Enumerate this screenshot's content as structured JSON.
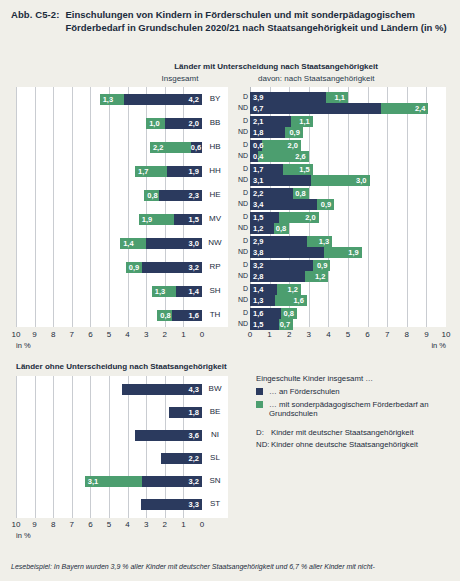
{
  "figure": {
    "number": "Abb. C5-2:",
    "title": "Einschulungen von Kindern in Förderschulen und mit sonderpädagogischem Förderbedarf in Grundschulen 2020/21 nach Staatsangehörigkeit und Ländern (in %)"
  },
  "section_top": {
    "heading": "Länder mit Unterscheidung nach Staatsangehörigkeit",
    "sub_left": "Insgesamt",
    "sub_right": "davon: nach Staatsangehörigkeit"
  },
  "section_bottom": {
    "heading": "Länder ohne Unterscheidung nach Staatsangehörigkeit"
  },
  "axis": {
    "ticks": [
      "10",
      "9",
      "8",
      "7",
      "6",
      "5",
      "4",
      "3",
      "2",
      "1",
      "0"
    ],
    "ticks_right": [
      "0",
      "1",
      "2",
      "3",
      "4",
      "5",
      "6",
      "7",
      "8",
      "9",
      "10"
    ],
    "unit": "in %",
    "max": 10
  },
  "legend": {
    "title": "Eingeschulte Kinder insgesamt …",
    "items": [
      {
        "color": "#2b3a5e",
        "label": "… an Förderschulen"
      },
      {
        "color": "#4c9e6f",
        "label": "… mit sonderpädagogischem Förderbedarf an Grundschulen"
      }
    ],
    "definitions": [
      {
        "key": "D:",
        "text": "Kinder mit deutscher Staatsangehörigkeit"
      },
      {
        "key": "ND:",
        "text": "Kinder ohne deutsche Staatsangehörigkeit"
      }
    ]
  },
  "footnote": "Lesebeispiel: In Bayern wurden 3,9 % aller Kinder mit deutscher Staatsangehörigkeit und 6,7 % aller Kinder mit nicht-",
  "colors": {
    "navy": "#2b3a5e",
    "green": "#4c9e6f",
    "page_bg": "#f0efe9",
    "plot_bg": "#ffffff",
    "gridline": "#c9ccd1"
  },
  "chart_data": [
    {
      "type": "bar",
      "id": "insgesamt",
      "title": "Insgesamt",
      "orientation": "horizontal-rtl",
      "stacked": true,
      "xlabel": "in %",
      "xlim": [
        0,
        10
      ],
      "grid": true,
      "categories": [
        "BY",
        "BB",
        "HB",
        "HH",
        "HE",
        "MV",
        "NW",
        "RP",
        "SH",
        "TH"
      ],
      "series": [
        {
          "name": "an Förderschulen",
          "color": "#2b3a5e",
          "values": [
            4.2,
            2.0,
            0.6,
            1.9,
            2.3,
            1.5,
            3.0,
            3.2,
            1.4,
            1.6
          ],
          "labels": [
            "4,2",
            "2,0",
            "0,6",
            "1,9",
            "2,3",
            "1,5",
            "3,0",
            "3,2",
            "1,4",
            "1,6"
          ]
        },
        {
          "name": "mit sonderpädagogischem Förderbedarf an Grundschulen",
          "color": "#4c9e6f",
          "values": [
            1.3,
            1.0,
            2.2,
            1.7,
            0.8,
            1.9,
            1.4,
            0.9,
            1.3,
            0.8
          ],
          "labels": [
            "1,3",
            "1,0",
            "2,2",
            "1,7",
            "0,8",
            "1,9",
            "1,4",
            "0,9",
            "1,3",
            "0,8"
          ]
        }
      ]
    },
    {
      "type": "bar",
      "id": "nach-staatsangehoerigkeit",
      "title": "davon: nach Staatsangehörigkeit",
      "orientation": "horizontal-ltr",
      "stacked": true,
      "xlabel": "in %",
      "xlim": [
        0,
        10
      ],
      "grid": true,
      "categories": [
        "BY",
        "BB",
        "HB",
        "HH",
        "HE",
        "MV",
        "NW",
        "RP",
        "SH",
        "TH"
      ],
      "subgroups": [
        "D",
        "ND"
      ],
      "rows": [
        {
          "state": "BY",
          "group": "D",
          "navy": 3.9,
          "green": 1.1,
          "navy_label": "3,9",
          "green_label": "1,1"
        },
        {
          "state": "BY",
          "group": "ND",
          "navy": 6.7,
          "green": 2.4,
          "navy_label": "6,7",
          "green_label": "2,4"
        },
        {
          "state": "BB",
          "group": "D",
          "navy": 2.1,
          "green": 1.1,
          "navy_label": "2,1",
          "green_label": "1,1"
        },
        {
          "state": "BB",
          "group": "ND",
          "navy": 1.8,
          "green": 0.9,
          "navy_label": "1,8",
          "green_label": "0,9"
        },
        {
          "state": "HB",
          "group": "D",
          "navy": 0.6,
          "green": 2.0,
          "navy_label": "0,6",
          "green_label": "2,0"
        },
        {
          "state": "HB",
          "group": "ND",
          "navy": 0.4,
          "green": 2.6,
          "navy_label": "0,4",
          "green_label": "2,6"
        },
        {
          "state": "HH",
          "group": "D",
          "navy": 1.7,
          "green": 1.5,
          "navy_label": "1,7",
          "green_label": "1,5"
        },
        {
          "state": "HH",
          "group": "ND",
          "navy": 3.1,
          "green": 3.0,
          "navy_label": "3,1",
          "green_label": "3,0"
        },
        {
          "state": "HE",
          "group": "D",
          "navy": 2.2,
          "green": 0.8,
          "navy_label": "2,2",
          "green_label": "0,8"
        },
        {
          "state": "HE",
          "group": "ND",
          "navy": 3.4,
          "green": 0.9,
          "navy_label": "3,4",
          "green_label": "0,9"
        },
        {
          "state": "MV",
          "group": "D",
          "navy": 1.5,
          "green": 2.0,
          "navy_label": "1,5",
          "green_label": "2,0"
        },
        {
          "state": "MV",
          "group": "ND",
          "navy": 1.2,
          "green": 0.8,
          "navy_label": "1,2",
          "green_label": "0,8"
        },
        {
          "state": "NW",
          "group": "D",
          "navy": 2.9,
          "green": 1.3,
          "navy_label": "2,9",
          "green_label": "1,3"
        },
        {
          "state": "NW",
          "group": "ND",
          "navy": 3.8,
          "green": 1.9,
          "navy_label": "3,8",
          "green_label": "1,9"
        },
        {
          "state": "RP",
          "group": "D",
          "navy": 3.2,
          "green": 0.9,
          "navy_label": "3,2",
          "green_label": "0,9"
        },
        {
          "state": "RP",
          "group": "ND",
          "navy": 2.8,
          "green": 1.2,
          "navy_label": "2,8",
          "green_label": "1,2"
        },
        {
          "state": "SH",
          "group": "D",
          "navy": 1.4,
          "green": 1.2,
          "navy_label": "1,4",
          "green_label": "1,2"
        },
        {
          "state": "SH",
          "group": "ND",
          "navy": 1.3,
          "green": 1.6,
          "navy_label": "1,3",
          "green_label": "1,6"
        },
        {
          "state": "TH",
          "group": "D",
          "navy": 1.6,
          "green": 0.8,
          "navy_label": "1,6",
          "green_label": "0,8"
        },
        {
          "state": "TH",
          "group": "ND",
          "navy": 1.5,
          "green": 0.7,
          "navy_label": "1,5",
          "green_label": "0,7"
        }
      ]
    },
    {
      "type": "bar",
      "id": "ohne-unterscheidung",
      "title": "Länder ohne Unterscheidung nach Staatsangehörigkeit",
      "orientation": "horizontal-rtl",
      "stacked": true,
      "xlabel": "in %",
      "xlim": [
        0,
        10
      ],
      "grid": true,
      "categories": [
        "BW",
        "BE",
        "NI",
        "SL",
        "SN",
        "ST"
      ],
      "series": [
        {
          "name": "an Förderschulen",
          "color": "#2b3a5e",
          "values": [
            4.3,
            1.8,
            3.6,
            2.2,
            3.2,
            3.3
          ],
          "labels": [
            "4,3",
            "1,8",
            "3,6",
            "2,2",
            "3,2",
            "3,3"
          ]
        },
        {
          "name": "mit sonderpädagogischem Förderbedarf an Grundschulen",
          "color": "#4c9e6f",
          "values": [
            0,
            0,
            0,
            0,
            3.1,
            0
          ],
          "labels": [
            "",
            "",
            "",
            "",
            "3,1",
            ""
          ]
        }
      ]
    }
  ]
}
